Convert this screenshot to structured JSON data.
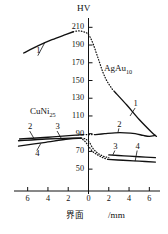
{
  "chart_data": {
    "type": "line",
    "title": "HV",
    "ylabel": "HV",
    "xlabel_center": "界面",
    "xlabel_unit": "/mm",
    "ylim": [
      40,
      216
    ],
    "xlim": [
      -7.2,
      7.2
    ],
    "grid": false,
    "legend_position": "inline-annotations",
    "yticks": [
      210,
      190,
      170,
      150,
      130,
      110,
      90,
      70,
      50
    ],
    "xticks": [
      {
        "value": -6,
        "label": "6"
      },
      {
        "value": -4,
        "label": "4"
      },
      {
        "value": -2,
        "label": "2"
      },
      {
        "value": 0,
        "label": "0"
      },
      {
        "value": 2,
        "label": "2"
      },
      {
        "value": 4,
        "label": "4"
      },
      {
        "value": 6,
        "label": "6"
      }
    ],
    "annotations": [
      {
        "name": "material-right",
        "text": "AgAu",
        "sub": "10"
      },
      {
        "name": "material-left",
        "text": "CuNi",
        "sub": "25"
      }
    ],
    "series": [
      {
        "name": "1-left",
        "label": "1",
        "style": "solid",
        "points": [
          [
            -6.4,
            181
          ],
          [
            -5.0,
            189
          ],
          [
            -3.6,
            196
          ],
          [
            -2.2,
            202
          ],
          [
            -1.5,
            205
          ]
        ]
      },
      {
        "name": "1-dotted-peak",
        "label": "",
        "style": "dotted",
        "points": [
          [
            -1.5,
            205
          ],
          [
            -1.0,
            206
          ],
          [
            -0.5,
            205
          ],
          [
            -0.1,
            203
          ],
          [
            0.2,
            198
          ],
          [
            0.5,
            190
          ],
          [
            0.8,
            180
          ],
          [
            1.1,
            170
          ],
          [
            1.4,
            160
          ],
          [
            1.7,
            152
          ],
          [
            2.0,
            146
          ],
          [
            2.3,
            141
          ],
          [
            2.6,
            137
          ]
        ]
      },
      {
        "name": "1-right",
        "label": "1",
        "style": "solid",
        "points": [
          [
            2.6,
            137
          ],
          [
            3.8,
            122
          ],
          [
            5.0,
            106
          ],
          [
            6.2,
            92
          ],
          [
            6.7,
            87
          ]
        ]
      },
      {
        "name": "2-left",
        "label": "2",
        "style": "solid",
        "points": [
          [
            -6.8,
            84
          ],
          [
            -4.0,
            86
          ],
          [
            -1.6,
            88
          ],
          [
            -0.5,
            89
          ]
        ]
      },
      {
        "name": "2-dotted",
        "label": "",
        "style": "dotted",
        "points": [
          [
            -0.5,
            89
          ],
          [
            -0.1,
            89
          ],
          [
            0.3,
            89
          ],
          [
            0.7,
            89
          ]
        ]
      },
      {
        "name": "2-right",
        "label": "2",
        "style": "solid",
        "points": [
          [
            0.7,
            89
          ],
          [
            1.6,
            90
          ],
          [
            2.6,
            91
          ],
          [
            3.6,
            91
          ],
          [
            4.6,
            90
          ],
          [
            5.4,
            88
          ],
          [
            6.0,
            87
          ],
          [
            6.6,
            88
          ]
        ]
      },
      {
        "name": "3-left",
        "label": "3",
        "style": "solid",
        "points": [
          [
            -6.9,
            82
          ],
          [
            -4.2,
            84
          ],
          [
            -1.8,
            85
          ],
          [
            -0.7,
            85
          ]
        ]
      },
      {
        "name": "3-dotted",
        "label": "",
        "style": "dotted",
        "points": [
          [
            -0.7,
            85
          ],
          [
            -0.3,
            84
          ],
          [
            0.1,
            80
          ],
          [
            0.4,
            74
          ],
          [
            0.8,
            69
          ],
          [
            1.2,
            66
          ],
          [
            1.6,
            64
          ],
          [
            2.0,
            63
          ]
        ]
      },
      {
        "name": "3-right",
        "label": "3",
        "style": "solid",
        "points": [
          [
            2.0,
            66
          ],
          [
            3.5,
            65
          ],
          [
            5.0,
            64
          ],
          [
            6.6,
            63
          ]
        ]
      },
      {
        "name": "4-left",
        "label": "4",
        "style": "solid",
        "points": [
          [
            -6.9,
            76
          ],
          [
            -4.4,
            80
          ],
          [
            -2.0,
            84
          ],
          [
            -0.8,
            85
          ]
        ]
      },
      {
        "name": "4-dotted",
        "label": "",
        "style": "dotted",
        "points": [
          [
            -0.8,
            85
          ],
          [
            -0.4,
            82
          ],
          [
            0.0,
            76
          ],
          [
            0.4,
            70
          ],
          [
            0.9,
            66
          ],
          [
            1.4,
            63
          ],
          [
            1.9,
            61
          ]
        ]
      },
      {
        "name": "4-right",
        "label": "4",
        "style": "solid",
        "points": [
          [
            1.9,
            61
          ],
          [
            3.4,
            60
          ],
          [
            5.0,
            59
          ],
          [
            6.6,
            58
          ]
        ]
      }
    ],
    "series_labels": [
      {
        "name": "label-1-left",
        "text": "1",
        "x": -5.0,
        "y": 183
      },
      {
        "name": "label-1-right",
        "text": "1",
        "x": 4.6,
        "y": 123
      },
      {
        "name": "label-2-left",
        "text": "2",
        "x": -5.8,
        "y": 97
      },
      {
        "name": "label-3-left",
        "text": "3",
        "x": -3.1,
        "y": 97
      },
      {
        "name": "label-4-left",
        "text": "4",
        "x": -5.1,
        "y": 67
      },
      {
        "name": "label-2-right",
        "text": "2",
        "x": 3.0,
        "y": 100
      },
      {
        "name": "label-3-right",
        "text": "3",
        "x": 2.6,
        "y": 75
      },
      {
        "name": "label-4-right",
        "text": "4",
        "x": 4.8,
        "y": 75
      }
    ]
  }
}
